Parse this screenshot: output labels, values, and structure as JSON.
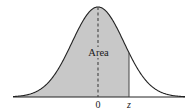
{
  "figure": {
    "area_label": "Area",
    "axis_labels": {
      "zero": "0",
      "z": "z"
    },
    "colors": {
      "shade": "#c8c8c8",
      "curve": "#222222",
      "axis": "#222222",
      "mean_line": "#444444",
      "background": "#ffffff"
    }
  },
  "chart_data": {
    "type": "area",
    "title": "",
    "xlabel": "",
    "ylabel": "",
    "distribution": "standard normal",
    "mean": 0,
    "shaded_region": {
      "from": "-infinity",
      "to": "z"
    },
    "z_approx": 0.65,
    "tick_labels": [
      "0",
      "z"
    ],
    "annotations": [
      "Area"
    ],
    "mean_line_style": "dashed",
    "z_line_style": "solid"
  }
}
